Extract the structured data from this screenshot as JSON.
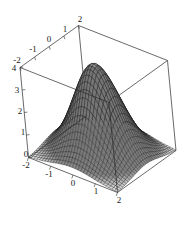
{
  "figure": {
    "title": "",
    "background_color": "#ffffff",
    "line_color": "#1a1a1a",
    "surface_fill_light": "#f2f2f2",
    "surface_fill_dark": "#4a4a4a"
  },
  "chart_data": {
    "type": "surface",
    "title": "",
    "xlabel": "",
    "ylabel": "",
    "zlabel": "",
    "xlim": [
      -2,
      2
    ],
    "ylim": [
      -2,
      2
    ],
    "zlim": [
      0,
      4
    ],
    "grid": false,
    "legend": "none",
    "projection": "3d-wireframe",
    "function": "gaussian bell peak centered at origin",
    "peak_value": 4,
    "mesh_lines_u": 32,
    "mesh_lines_v": 32,
    "x_ticks": [
      "-2",
      "-1",
      "0",
      "1",
      "2"
    ],
    "y_ticks": [
      "-2",
      "-1",
      "0",
      "1",
      "2"
    ],
    "z_ticks": [
      "0",
      "1",
      "2",
      "3",
      "4"
    ],
    "x_values": [
      -2,
      -1,
      0,
      1,
      2
    ],
    "y_values": [
      -2,
      -1,
      0,
      1,
      2
    ],
    "z_values": [
      0,
      1,
      2,
      3,
      4
    ],
    "surface_grid": {
      "x": [
        -2,
        -1.5,
        -1,
        -0.5,
        0,
        0.5,
        1,
        1.5,
        2
      ],
      "y": [
        -2,
        -1.5,
        -1,
        -0.5,
        0,
        0.5,
        1,
        1.5,
        2
      ],
      "z": [
        [
          0.0,
          0.01,
          0.03,
          0.06,
          0.07,
          0.06,
          0.03,
          0.01,
          0.0
        ],
        [
          0.01,
          0.05,
          0.18,
          0.38,
          0.49,
          0.38,
          0.18,
          0.05,
          0.01
        ],
        [
          0.03,
          0.18,
          0.59,
          1.25,
          1.62,
          1.25,
          0.59,
          0.18,
          0.03
        ],
        [
          0.06,
          0.38,
          1.25,
          2.65,
          3.43,
          2.65,
          1.25,
          0.38,
          0.06
        ],
        [
          0.07,
          0.49,
          1.62,
          3.43,
          4.0,
          3.43,
          1.62,
          0.49,
          0.07
        ],
        [
          0.06,
          0.38,
          1.25,
          2.65,
          3.43,
          2.65,
          1.25,
          0.38,
          0.06
        ],
        [
          0.03,
          0.18,
          0.59,
          1.25,
          1.62,
          1.25,
          0.59,
          0.18,
          0.03
        ],
        [
          0.01,
          0.05,
          0.18,
          0.38,
          0.49,
          0.38,
          0.18,
          0.05,
          0.01
        ],
        [
          0.0,
          0.01,
          0.03,
          0.06,
          0.07,
          0.06,
          0.03,
          0.01,
          0.0
        ]
      ]
    }
  },
  "axes": {
    "x_axis": {
      "name": "x-axis",
      "ticks": [
        {
          "label": "-2",
          "x": 26,
          "y": 168
        },
        {
          "label": "-1",
          "x": 49,
          "y": 177
        },
        {
          "label": "0",
          "x": 73,
          "y": 186
        },
        {
          "label": "1",
          "x": 96,
          "y": 194
        },
        {
          "label": "2",
          "x": 119,
          "y": 203
        }
      ]
    },
    "y_axis": {
      "name": "y-axis",
      "ticks": [
        {
          "label": "-2",
          "x": 17,
          "y": 63
        },
        {
          "label": "-1",
          "x": 33,
          "y": 52
        },
        {
          "label": "0",
          "x": 49,
          "y": 42
        },
        {
          "label": "1",
          "x": 65,
          "y": 32
        },
        {
          "label": "2",
          "x": 80,
          "y": 22
        }
      ]
    },
    "z_axis": {
      "name": "z-axis",
      "ticks": [
        {
          "label": "4",
          "x": 14,
          "y": 71
        },
        {
          "label": "3",
          "x": 17,
          "y": 93
        },
        {
          "label": "2",
          "x": 20,
          "y": 114
        },
        {
          "label": "1",
          "x": 23,
          "y": 135
        },
        {
          "label": "0",
          "x": 26,
          "y": 157
        }
      ]
    }
  }
}
